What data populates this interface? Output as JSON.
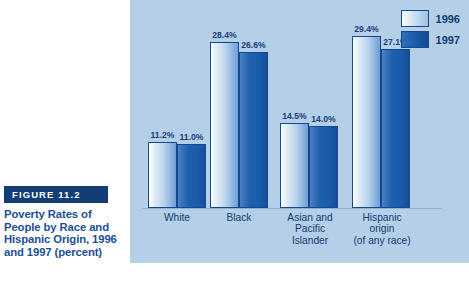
{
  "figure": {
    "badge": "FIGURE 11.2",
    "caption": "Poverty Rates of People by Race and Hispanic Origin, 1996 and 1997 (percent)"
  },
  "legend": {
    "position": "top-right",
    "entries": [
      {
        "label": "1996",
        "color": "#cfe0f2",
        "swatch": "y1996"
      },
      {
        "label": "1997",
        "color": "#1a5cab",
        "swatch": "y1997"
      }
    ]
  },
  "colors": {
    "panel_background": "#b6cfe8",
    "page_background": "#ffffff",
    "badge_background": "#123d75",
    "caption_text": "#1a4f95",
    "series_1996": "#cfe0f2",
    "series_1997": "#1a5cab",
    "bar_border": "#14498f"
  },
  "chart_data": {
    "type": "bar",
    "title": "Poverty Rates of People by Race and Hispanic Origin, 1996 and 1997 (percent)",
    "xlabel": "",
    "ylabel": "",
    "ylim": [
      0,
      32
    ],
    "grid": false,
    "legend_position": "top-right",
    "categories": [
      "White",
      "Black",
      "Asian and Pacific Islander",
      "Hispanic origin (of any race)"
    ],
    "category_lines": [
      [
        "White"
      ],
      [
        "Black"
      ],
      [
        "Asian and",
        "Pacific",
        "Islander"
      ],
      [
        "Hispanic",
        "origin",
        "(of any race)"
      ]
    ],
    "series": [
      {
        "name": "1996",
        "values": [
          11.2,
          28.4,
          14.5,
          29.4
        ],
        "labels": [
          "11.2%",
          "28.4%",
          "14.5%",
          "29.4%"
        ]
      },
      {
        "name": "1997",
        "values": [
          11.0,
          26.6,
          14.0,
          27.1
        ],
        "labels": [
          "11.0%",
          "26.6%",
          "14.0%",
          "27.1%"
        ]
      }
    ]
  }
}
